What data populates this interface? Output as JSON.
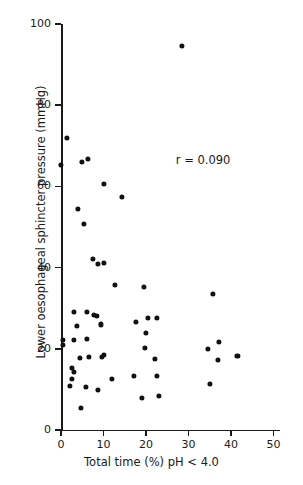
{
  "chart_data": {
    "type": "scatter",
    "title": "",
    "xlabel": "Total time (%) pH < 4.0",
    "ylabel": "Lower oesophageal sphincter pressure (mmHg)",
    "xlim": [
      0,
      51.5
    ],
    "ylim": [
      0,
      100
    ],
    "xticks": [
      0,
      10,
      20,
      30,
      40,
      50
    ],
    "xticklabels": [
      "0",
      "10",
      "20",
      "30",
      "40",
      "50"
    ],
    "yticks": [
      0,
      20,
      40,
      60,
      80,
      100
    ],
    "yticklabels": [
      "0",
      "20",
      "40",
      "60",
      "80",
      "100"
    ],
    "grid": false,
    "legend": null,
    "annotations": [
      {
        "text": "r = 0.090",
        "x": 27.0,
        "y": 66.5
      }
    ],
    "marker": {
      "shape": "circle",
      "color": "#111111",
      "size_px": 5.2
    },
    "points": [
      {
        "x": 1.4,
        "y": 71.9
      },
      {
        "x": 0.0,
        "y": 65.3
      },
      {
        "x": 4.9,
        "y": 66.0
      },
      {
        "x": 6.4,
        "y": 66.7
      },
      {
        "x": 10.1,
        "y": 60.6
      },
      {
        "x": 14.4,
        "y": 57.4
      },
      {
        "x": 4.0,
        "y": 54.4
      },
      {
        "x": 5.4,
        "y": 50.7
      },
      {
        "x": 7.5,
        "y": 42.1
      },
      {
        "x": 8.7,
        "y": 40.9
      },
      {
        "x": 10.1,
        "y": 41.1
      },
      {
        "x": 12.7,
        "y": 35.7
      },
      {
        "x": 19.5,
        "y": 35.2
      },
      {
        "x": 35.8,
        "y": 33.5
      },
      {
        "x": 3.1,
        "y": 29.1
      },
      {
        "x": 6.1,
        "y": 29.0
      },
      {
        "x": 7.8,
        "y": 28.3
      },
      {
        "x": 8.5,
        "y": 28.1
      },
      {
        "x": 17.6,
        "y": 26.6
      },
      {
        "x": 20.5,
        "y": 27.7
      },
      {
        "x": 22.6,
        "y": 27.7
      },
      {
        "x": 9.4,
        "y": 26.0
      },
      {
        "x": 3.8,
        "y": 25.6
      },
      {
        "x": 20.0,
        "y": 23.9
      },
      {
        "x": 0.5,
        "y": 22.2
      },
      {
        "x": 3.1,
        "y": 22.1
      },
      {
        "x": 6.1,
        "y": 22.5
      },
      {
        "x": 37.2,
        "y": 21.7
      },
      {
        "x": 0.5,
        "y": 20.9
      },
      {
        "x": 19.8,
        "y": 20.2
      },
      {
        "x": 34.6,
        "y": 20.0
      },
      {
        "x": 4.5,
        "y": 17.7
      },
      {
        "x": 6.6,
        "y": 18.1
      },
      {
        "x": 9.6,
        "y": 18.1
      },
      {
        "x": 10.1,
        "y": 18.5
      },
      {
        "x": 22.1,
        "y": 17.6
      },
      {
        "x": 37.0,
        "y": 17.2
      },
      {
        "x": 41.5,
        "y": 18.2
      },
      {
        "x": 2.6,
        "y": 15.3
      },
      {
        "x": 3.1,
        "y": 14.3
      },
      {
        "x": 2.6,
        "y": 12.6
      },
      {
        "x": 2.1,
        "y": 10.8
      },
      {
        "x": 5.9,
        "y": 10.6
      },
      {
        "x": 8.7,
        "y": 9.9
      },
      {
        "x": 12.0,
        "y": 12.6
      },
      {
        "x": 17.2,
        "y": 13.3
      },
      {
        "x": 22.6,
        "y": 13.3
      },
      {
        "x": 35.0,
        "y": 11.3
      },
      {
        "x": 19.1,
        "y": 7.9
      },
      {
        "x": 23.1,
        "y": 8.4
      },
      {
        "x": 4.7,
        "y": 5.4
      },
      {
        "x": 28.5,
        "y": 94.6
      }
    ]
  }
}
